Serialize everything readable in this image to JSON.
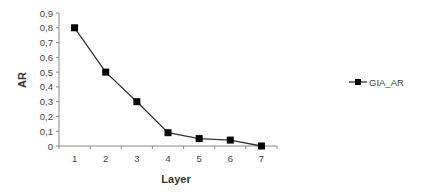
{
  "chart_data": {
    "type": "line",
    "title": "",
    "xlabel": "Layer",
    "ylabel": "AR",
    "categories": [
      "1",
      "2",
      "3",
      "4",
      "5",
      "6",
      "7"
    ],
    "series": [
      {
        "name": "GIA_AR",
        "values": [
          0.8,
          0.5,
          0.3,
          0.09,
          0.05,
          0.04,
          0.0
        ],
        "color": "#000000",
        "marker": "square"
      }
    ],
    "ylim": [
      0,
      0.9
    ],
    "yticks": [
      "0",
      "0,1",
      "0,2",
      "0,3",
      "0,4",
      "0,5",
      "0,6",
      "0,7",
      "0,8",
      "0,9"
    ],
    "grid": false,
    "legend_position": "right"
  },
  "legend": {
    "label": "GIA_AR"
  },
  "axes": {
    "x_title": "Layer",
    "y_title": "AR"
  }
}
